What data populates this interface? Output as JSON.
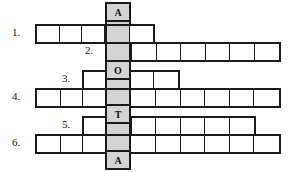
{
  "puzzle": {
    "type": "crossword-word-ladder",
    "keyword_column": {
      "name": "vertical-keyword",
      "letters": [
        "A",
        "O",
        "T",
        "A"
      ],
      "shade_color": "#d4d4d4",
      "border_color": "#1a1a1a"
    },
    "rows": [
      {
        "number": "1.",
        "cells_before_key": 3,
        "cells_after_key": 1,
        "total_cells": 5,
        "key_letter": "A"
      },
      {
        "number": "2.",
        "cells_before_key": 0,
        "cells_after_key": 6,
        "total_cells": 7,
        "key_letter": ""
      },
      {
        "number": "3.",
        "cells_before_key": 1,
        "cells_after_key": 2,
        "total_cells": 4,
        "key_letter": "O"
      },
      {
        "number": "4.",
        "cells_before_key": 3,
        "cells_after_key": 6,
        "total_cells": 10,
        "key_letter": ""
      },
      {
        "number": "5.",
        "cells_before_key": 1,
        "cells_after_key": 5,
        "total_cells": 7,
        "key_letter": "T"
      },
      {
        "number": "6.",
        "cells_before_key": 3,
        "cells_after_key": 6,
        "total_cells": 10,
        "key_letter": ""
      }
    ],
    "key_letter_cells": [
      {
        "letter": "A",
        "position": "top"
      },
      {
        "letter": "O",
        "position": "upper-middle"
      },
      {
        "letter": "T",
        "position": "lower-middle"
      },
      {
        "letter": "A",
        "position": "bottom"
      }
    ]
  }
}
